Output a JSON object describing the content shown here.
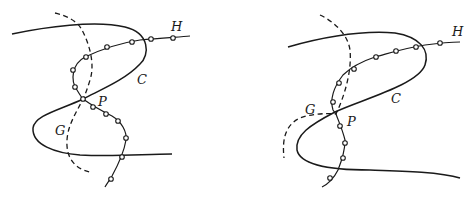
{
  "figures": [
    {
      "id": "left",
      "labels": {
        "H": "H",
        "C": "C",
        "P": "P",
        "G": "G"
      },
      "curves": {
        "C": "solid",
        "G": "dashed",
        "H": "solid with circular nodes"
      }
    },
    {
      "id": "right",
      "labels": {
        "H": "H",
        "C": "C",
        "P": "P",
        "G": "G"
      },
      "curves": {
        "C": "solid",
        "G": "dashed",
        "H": "solid with circular nodes"
      }
    }
  ],
  "colors": {
    "stroke": "#1a1a1a",
    "background": "#ffffff"
  }
}
